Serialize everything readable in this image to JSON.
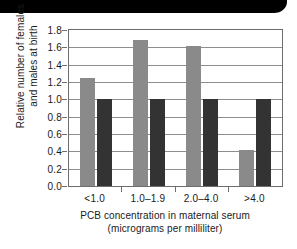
{
  "chart_data": {
    "type": "bar",
    "title": "",
    "xlabel": "PCB concentration in maternal serum",
    "xlabel_line2": "(micrograms per milliliter)",
    "ylabel_line1": "Relative number of females",
    "ylabel_line2": "and males at birth",
    "categories": [
      "<1.0",
      "1.0–1.9",
      "2.0–4.0",
      ">4.0"
    ],
    "series": [
      {
        "name": "females",
        "color": "#8a8a8a",
        "values": [
          1.25,
          1.69,
          1.61,
          0.41
        ]
      },
      {
        "name": "males",
        "color": "#333333",
        "values": [
          1.0,
          1.0,
          1.0,
          1.0
        ]
      }
    ],
    "ylim": [
      0.0,
      1.8
    ],
    "ytick_labels": [
      "0.0",
      "0.2",
      "0.4",
      "0.6",
      "0.8",
      "1.0",
      "1.2",
      "1.4",
      "1.6",
      "1.8"
    ],
    "ytick_values": [
      0.0,
      0.2,
      0.4,
      0.6,
      0.8,
      1.0,
      1.2,
      1.4,
      1.6,
      1.8
    ],
    "grid": true,
    "legend": "none"
  },
  "decor": {
    "top_band_color": "#000000"
  }
}
